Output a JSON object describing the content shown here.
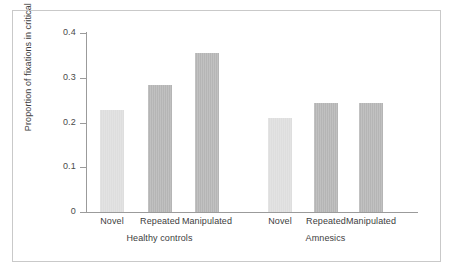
{
  "chart_data": {
    "type": "bar",
    "title": "",
    "xlabel": "",
    "ylabel": "Proportion of fixations in critical region",
    "ylim": [
      0,
      0.4
    ],
    "yticks": [
      "0",
      "0.1",
      "0.2",
      "0.3",
      "0.4"
    ],
    "ytick_values": [
      0,
      0.1,
      0.2,
      0.3,
      0.4
    ],
    "grid": false,
    "legend": "none",
    "categories": [
      "Novel",
      "Repeated",
      "Manipulated"
    ],
    "groups": [
      "Healthy controls",
      "Amnesics"
    ],
    "bars": [
      {
        "group": "Healthy controls",
        "category": "Novel",
        "value": 0.228,
        "shade": "light"
      },
      {
        "group": "Healthy controls",
        "category": "Repeated",
        "value": 0.283,
        "shade": "dark"
      },
      {
        "group": "Healthy controls",
        "category": "Manipulated",
        "value": 0.355,
        "shade": "dark"
      },
      {
        "group": "Amnesics",
        "category": "Novel",
        "value": 0.21,
        "shade": "light"
      },
      {
        "group": "Amnesics",
        "category": "Repeated",
        "value": 0.243,
        "shade": "dark"
      },
      {
        "group": "Amnesics",
        "category": "Manipulated",
        "value": 0.243,
        "shade": "dark"
      }
    ],
    "series": [
      {
        "name": "Healthy controls",
        "values": [
          0.228,
          0.283,
          0.355
        ]
      },
      {
        "name": "Amnesics",
        "values": [
          0.21,
          0.243,
          0.243
        ]
      }
    ],
    "colors": {
      "bar_light": "#dedede",
      "bar_dark": "#b5b5b5",
      "axis": "#9b9b9b",
      "text": "#3d3d3d",
      "frame": "#c9c9c9",
      "background": "#ffffff"
    }
  }
}
